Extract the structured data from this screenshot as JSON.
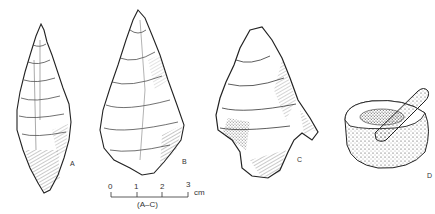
{
  "figure": {
    "artifacts": [
      {
        "id": "A",
        "label": "A",
        "description": "elongated pressure-flaked point"
      },
      {
        "id": "B",
        "label": "B",
        "description": "leaf-shaped flaked biface"
      },
      {
        "id": "C",
        "label": "C",
        "description": "shouldered flaked point"
      },
      {
        "id": "D",
        "label": "D",
        "description": "stone mortar and pestle"
      }
    ],
    "scale_bar": {
      "ticks": [
        "0",
        "1",
        "2",
        "3"
      ],
      "unit": "cm",
      "applies_to": "(A–C)"
    }
  }
}
